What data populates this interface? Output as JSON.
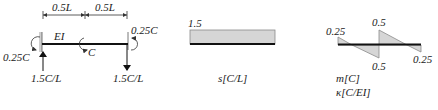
{
  "beam": {
    "dimension_left": "0.5L",
    "dimension_right": "0.5L",
    "stiffness_label": "EI",
    "left_moment": "0.25C",
    "center_moment": "C",
    "right_moment": "0.25C",
    "left_reaction": "1.5C/L",
    "right_reaction": "1.5C/L"
  },
  "shear_diagram": {
    "value_label": "1.5",
    "axis_label": "s[C/L]"
  },
  "moment_diagram": {
    "left_value": "0.25",
    "mid_top_value": "0.5",
    "mid_bottom_value": "0.5",
    "right_value": "0.25",
    "axis_label_1": "m[C]",
    "axis_label_2": "κ[C/EI]"
  },
  "colors": {
    "line": "#111111",
    "fill": "#d6d6d6",
    "outline": "#8a8a8a"
  }
}
